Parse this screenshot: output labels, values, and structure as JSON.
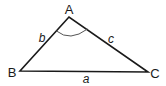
{
  "diagram": {
    "type": "triangle",
    "vertices": [
      {
        "label": "A",
        "x": 69,
        "y": 17
      },
      {
        "label": "B",
        "x": 20,
        "y": 71
      },
      {
        "label": "C",
        "x": 148,
        "y": 72
      }
    ],
    "sides": [
      {
        "label": "a",
        "between": [
          "B",
          "C"
        ]
      },
      {
        "label": "b",
        "between": [
          "A",
          "B"
        ]
      },
      {
        "label": "c",
        "between": [
          "A",
          "C"
        ]
      }
    ],
    "angle_marker": {
      "at": "A"
    }
  },
  "labels": {
    "A": "A",
    "B": "B",
    "C": "C",
    "a": "a",
    "b": "b",
    "c": "c"
  },
  "colors": {
    "stroke": "#1a1a1a",
    "arc": "#555555",
    "background": "#ffffff"
  }
}
